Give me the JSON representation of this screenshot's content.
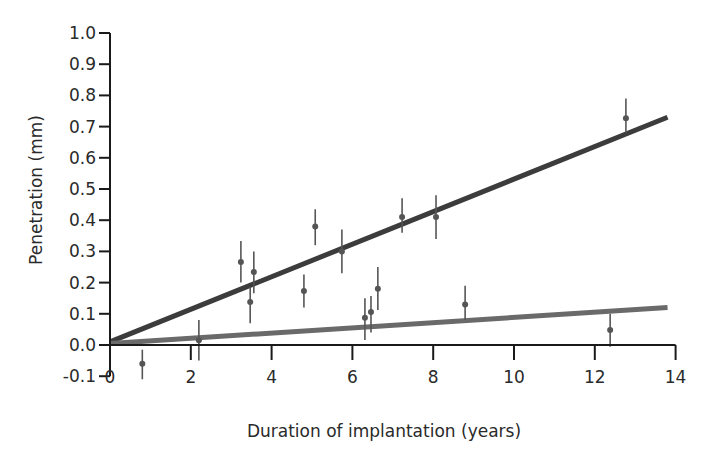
{
  "chart_data": {
    "type": "scatter",
    "title": "",
    "xlabel": "Duration of implantation (years)",
    "ylabel": "Penetration (mm)",
    "xlim": [
      0,
      14
    ],
    "ylim": [
      -0.1,
      1.0
    ],
    "x_ticks": [
      0,
      2,
      4,
      6,
      8,
      10,
      12,
      14
    ],
    "x_tick_labels": [
      "0",
      "2",
      "4",
      "6",
      "8",
      "10",
      "12",
      "14"
    ],
    "y_ticks": [
      -0.1,
      0.0,
      0.1,
      0.2,
      0.3,
      0.4,
      0.5,
      0.6,
      0.7,
      0.8,
      0.9,
      1.0
    ],
    "y_tick_labels": [
      "-0.1",
      "0.0",
      "0.1",
      "0.2",
      "0.3",
      "0.4",
      "0.5",
      "0.6",
      "0.7",
      "0.8",
      "0.9",
      "1.0"
    ],
    "grid": false,
    "legend": null,
    "points": [
      {
        "x": 0.8,
        "y": -0.06,
        "err_low": -0.11,
        "err_high": -0.015
      },
      {
        "x": 2.2,
        "y": 0.015,
        "err_low": -0.05,
        "err_high": 0.08
      },
      {
        "x": 3.24,
        "y": 0.266,
        "err_low": 0.2,
        "err_high": 0.333
      },
      {
        "x": 3.47,
        "y": 0.138,
        "err_low": 0.07,
        "err_high": 0.186
      },
      {
        "x": 3.56,
        "y": 0.234,
        "err_low": 0.166,
        "err_high": 0.3
      },
      {
        "x": 4.8,
        "y": 0.173,
        "err_low": 0.12,
        "err_high": 0.226
      },
      {
        "x": 5.08,
        "y": 0.38,
        "err_low": 0.32,
        "err_high": 0.435
      },
      {
        "x": 5.74,
        "y": 0.3,
        "err_low": 0.23,
        "err_high": 0.37
      },
      {
        "x": 6.31,
        "y": 0.087,
        "err_low": 0.016,
        "err_high": 0.15
      },
      {
        "x": 6.46,
        "y": 0.106,
        "err_low": 0.04,
        "err_high": 0.157
      },
      {
        "x": 6.63,
        "y": 0.18,
        "err_low": 0.112,
        "err_high": 0.25
      },
      {
        "x": 7.23,
        "y": 0.41,
        "err_low": 0.36,
        "err_high": 0.47
      },
      {
        "x": 8.07,
        "y": 0.41,
        "err_low": 0.34,
        "err_high": 0.48
      },
      {
        "x": 8.79,
        "y": 0.13,
        "err_low": 0.08,
        "err_high": 0.19
      },
      {
        "x": 12.38,
        "y": 0.048,
        "err_low": -0.006,
        "err_high": 0.1
      },
      {
        "x": 12.77,
        "y": 0.727,
        "err_low": 0.68,
        "err_high": 0.79
      }
    ],
    "series": [
      {
        "name": "upper-trend-line",
        "type": "line",
        "color": "#3c3c3c",
        "x": [
          0,
          13.8
        ],
        "y": [
          0.01,
          0.73
        ]
      },
      {
        "name": "lower-trend-line",
        "type": "line",
        "color": "#6a6a6a",
        "x": [
          0,
          13.8
        ],
        "y": [
          0.005,
          0.12
        ]
      }
    ],
    "colors": {
      "axis": "#1a1a1a",
      "point": "#555555",
      "upper_line": "#3c3c3c",
      "lower_line": "#6a6a6a"
    }
  }
}
